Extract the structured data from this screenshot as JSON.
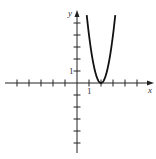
{
  "chart_data": {
    "type": "line",
    "title": "",
    "xlabel": "x",
    "ylabel": "y",
    "x_tick_label": "1",
    "y_tick_label": "1",
    "xlim": [
      -5.5,
      6.5
    ],
    "ylim": [
      -6,
      6
    ],
    "grid": false,
    "legend": null,
    "series": [
      {
        "name": "parabola (estimated fit)",
        "formula_estimate": "y = 4(x - 2)^2",
        "vertex_estimate": [
          2,
          0
        ],
        "x": [
          0.6,
          0.8,
          1.0,
          1.2,
          1.4,
          1.6,
          1.8,
          2.0,
          2.2,
          2.4,
          2.6,
          2.8,
          3.0,
          3.2,
          3.4
        ],
        "y": [
          7.84,
          5.76,
          4.0,
          2.56,
          1.44,
          0.64,
          0.16,
          0,
          0.16,
          0.64,
          1.44,
          2.56,
          4.0,
          5.76,
          7.84
        ]
      }
    ]
  },
  "axes": {
    "x_label": "x",
    "y_label": "y",
    "x_unit_label": "1",
    "y_unit_label": "1",
    "color": "#222222"
  },
  "curve": {
    "color": "#111111"
  }
}
